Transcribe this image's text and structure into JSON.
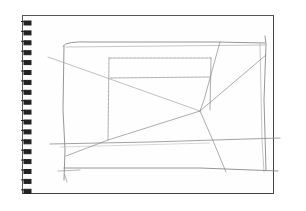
{
  "image": {
    "subject": "pencil perspective sketch on spiral notebook page",
    "ring_count": 18,
    "colors": {
      "page": "#fefefe",
      "page_border": "#555555",
      "ring": "#222222",
      "pencil": "#8a8a8a",
      "pencil_light": "#b0b0b0"
    }
  },
  "sketch": {
    "outer_rect": {
      "x1": 63,
      "y1": 44,
      "x2": 266,
      "y2": 176
    },
    "inner_rect": {
      "x1": 109,
      "y1": 58,
      "x2": 212,
      "y2": 110
    },
    "vanishing_point": {
      "x": 200,
      "y": 111
    }
  }
}
